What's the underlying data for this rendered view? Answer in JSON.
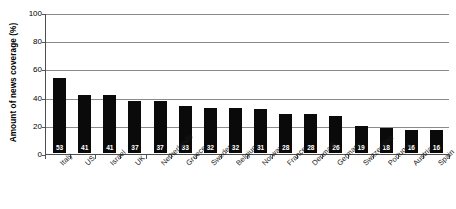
{
  "chart_data": {
    "type": "bar",
    "title": "",
    "xlabel": "",
    "ylabel": "Amount of news coverage (%)",
    "ylim": [
      0,
      100
    ],
    "yticks": [
      0,
      20,
      40,
      60,
      80,
      100
    ],
    "ytick_labels": [
      "0",
      "20",
      "40",
      "60",
      "80",
      "100"
    ],
    "grid": "horizontal",
    "legend": "none",
    "bar_color": "#0a0a0a",
    "value_label_color": "#ffffff",
    "categories": [
      "Italy",
      "US",
      "Israel",
      "UK",
      "Netherlands",
      "Greece",
      "Sweden",
      "Belgium",
      "Norway",
      "France",
      "Denmark",
      "Germany",
      "Switzerland",
      "Portugal",
      "Austria",
      "Spain"
    ],
    "values": [
      53,
      41,
      41,
      37,
      37,
      33,
      32,
      32,
      31,
      28,
      28,
      26,
      19,
      18,
      16,
      16
    ],
    "value_labels": [
      "53",
      "41",
      "41",
      "37",
      "37",
      "33",
      "32",
      "32",
      "31",
      "28",
      "28",
      "26",
      "19",
      "18",
      "16",
      "16"
    ]
  }
}
